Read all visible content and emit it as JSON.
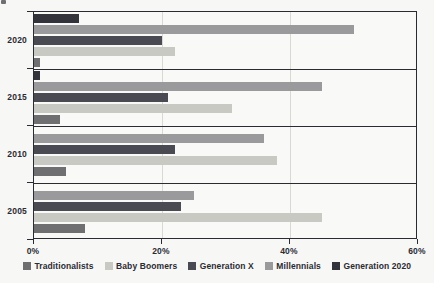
{
  "chart_data": {
    "type": "bar",
    "orientation": "horizontal",
    "title": "",
    "subtitle": "",
    "xlabel": "",
    "ylabel": "",
    "categories": [
      "2020",
      "2015",
      "2010",
      "2005"
    ],
    "xlim": [
      0,
      60
    ],
    "x_ticks": [
      0,
      20,
      40,
      60
    ],
    "x_tick_labels": [
      "0%",
      "20%",
      "40%",
      "60%"
    ],
    "grid": true,
    "grid_axis": "x",
    "legend_position": "bottom",
    "value_unit": "%",
    "series": [
      {
        "name": "Traditionalists",
        "color": "#6f6f72",
        "values": [
          1.0,
          4.0,
          5.0,
          8.0
        ]
      },
      {
        "name": "Baby Boomers",
        "color": "#c9c9c4",
        "values": [
          22.0,
          31.0,
          38.0,
          45.0
        ]
      },
      {
        "name": "Generation X",
        "color": "#4a4a52",
        "values": [
          20.0,
          21.0,
          22.0,
          23.0
        ]
      },
      {
        "name": "Millennials",
        "color": "#9a9a9c",
        "values": [
          50.0,
          45.0,
          36.0,
          25.0
        ]
      },
      {
        "name": "Generation 2020",
        "color": "#33333b",
        "values": [
          7.0,
          1.0,
          0.0,
          0.0
        ]
      }
    ],
    "bar_draw_order_top_to_bottom": [
      "Generation 2020",
      "Millennials",
      "Generation X",
      "Baby Boomers",
      "Traditionalists"
    ]
  },
  "legend": {
    "items": [
      {
        "label": "Traditionalists",
        "color": "#6f6f72"
      },
      {
        "label": "Baby Boomers",
        "color": "#c9c9c4"
      },
      {
        "label": "Generation X",
        "color": "#4a4a52"
      },
      {
        "label": "Millennials",
        "color": "#9a9a9c"
      },
      {
        "label": "Generation 2020",
        "color": "#33333b"
      }
    ]
  },
  "axis": {
    "x_tick_labels": [
      "0%",
      "20%",
      "40%",
      "60%"
    ],
    "y_tick_labels": [
      "2020",
      "2015",
      "2010",
      "2005"
    ]
  },
  "colors": {
    "background": "#f7f7f5",
    "plot_background": "#f9f9f7",
    "axis": "#2b2b33",
    "grid": "#d9d9d4",
    "text": "#2b2b33"
  }
}
